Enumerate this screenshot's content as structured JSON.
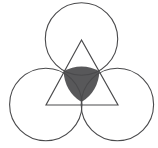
{
  "figure": {
    "title": "Three mutually tangent circles with inscribed equilateral triangle",
    "background_color": "#ffffff",
    "stroke_color": "#4a4a4c",
    "shaded_fill_color": "#58585a",
    "stroke_width": 1.1,
    "canvas": {
      "width": 158,
      "height": 148
    }
  },
  "chart_data": {
    "type": "diagram",
    "circle_radius": 36.2,
    "circles": [
      {
        "name": "top-circle",
        "cx": 81.5,
        "cy": 39.0,
        "r": 36.2
      },
      {
        "name": "bottom-left-circle",
        "cx": 45.8,
        "cy": 104.5,
        "r": 36.2
      },
      {
        "name": "bottom-right-circle",
        "cx": 117.4,
        "cy": 104.5,
        "r": 36.2
      }
    ],
    "triangle": {
      "name": "equilateral-triangle",
      "vertices": [
        {
          "label": "apex",
          "x": 81.5,
          "y": 40.0
        },
        {
          "label": "bottom-left",
          "x": 46.0,
          "y": 105.0
        },
        {
          "label": "bottom-right",
          "x": 118.0,
          "y": 105.0
        }
      ],
      "side_length": 72
    },
    "shaded_region": {
      "name": "central-curvilinear-triangle",
      "fill": "#58585a",
      "arc_radius": 36.2,
      "corners": [
        {
          "label": "left-corner",
          "x": 63.7,
          "y": 71.3
        },
        {
          "label": "right-corner",
          "x": 99.3,
          "y": 71.3
        },
        {
          "label": "bottom-corner",
          "x": 81.5,
          "y": 102.0
        }
      ]
    },
    "tangency_points": [
      {
        "label": "top-left-tangency",
        "x": 63.7,
        "y": 71.8
      },
      {
        "label": "top-right-tangency",
        "x": 99.3,
        "y": 71.8
      },
      {
        "label": "bottom-tangency",
        "x": 81.5,
        "y": 104.5
      }
    ],
    "bounding_box": {
      "left": 9.6,
      "top": 2.8,
      "right": 153.6,
      "bottom": 140.7
    },
    "grid": false,
    "legend": false,
    "xlabel": "",
    "ylabel": ""
  }
}
